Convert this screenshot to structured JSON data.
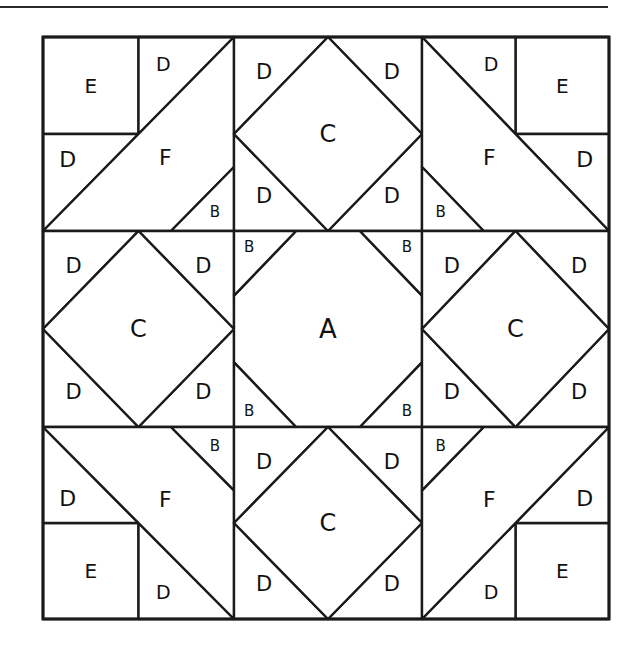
{
  "diagram": {
    "type": "quilt-block-template",
    "grid": {
      "rows": 3,
      "cols": 3,
      "x_lines": [
        43,
        234,
        422,
        609
      ],
      "y_lines": [
        37,
        231,
        427,
        619
      ]
    },
    "colors": {
      "line": "#1a1a1a",
      "fill": "#ffffff",
      "label": "#111111"
    },
    "blocks": [
      {
        "id": "top-left",
        "type": "corner-f",
        "orientation": "up-right",
        "pieces": [
          {
            "label": "E",
            "role": "square"
          },
          {
            "label": "D",
            "role": "triangle-top"
          },
          {
            "label": "D",
            "role": "triangle-left"
          },
          {
            "label": "F",
            "role": "trapezoid"
          },
          {
            "label": "B",
            "role": "small-triangle"
          }
        ]
      },
      {
        "id": "top-center",
        "type": "square-in-square",
        "pieces": [
          {
            "label": "C",
            "role": "diamond"
          },
          {
            "label": "D",
            "role": "corner-tl"
          },
          {
            "label": "D",
            "role": "corner-tr"
          },
          {
            "label": "D",
            "role": "corner-bl"
          },
          {
            "label": "D",
            "role": "corner-br"
          }
        ]
      },
      {
        "id": "top-right",
        "type": "corner-f",
        "orientation": "up-left",
        "pieces": [
          {
            "label": "E",
            "role": "square"
          },
          {
            "label": "D",
            "role": "triangle-top"
          },
          {
            "label": "D",
            "role": "triangle-right"
          },
          {
            "label": "F",
            "role": "trapezoid"
          },
          {
            "label": "B",
            "role": "small-triangle"
          }
        ]
      },
      {
        "id": "middle-left",
        "type": "square-in-square",
        "pieces": [
          {
            "label": "C",
            "role": "diamond"
          },
          {
            "label": "D",
            "role": "corner-tl"
          },
          {
            "label": "D",
            "role": "corner-tr"
          },
          {
            "label": "D",
            "role": "corner-bl"
          },
          {
            "label": "D",
            "role": "corner-br"
          }
        ]
      },
      {
        "id": "center",
        "type": "snowball",
        "pieces": [
          {
            "label": "A",
            "role": "octagon"
          },
          {
            "label": "B",
            "role": "corner-tl"
          },
          {
            "label": "B",
            "role": "corner-tr"
          },
          {
            "label": "B",
            "role": "corner-bl"
          },
          {
            "label": "B",
            "role": "corner-br"
          }
        ]
      },
      {
        "id": "middle-right",
        "type": "square-in-square",
        "pieces": [
          {
            "label": "C",
            "role": "diamond"
          },
          {
            "label": "D",
            "role": "corner-tl"
          },
          {
            "label": "D",
            "role": "corner-tr"
          },
          {
            "label": "D",
            "role": "corner-bl"
          },
          {
            "label": "D",
            "role": "corner-br"
          }
        ]
      },
      {
        "id": "bottom-left",
        "type": "corner-f",
        "orientation": "down-right",
        "pieces": [
          {
            "label": "E",
            "role": "square"
          },
          {
            "label": "D",
            "role": "triangle-bottom"
          },
          {
            "label": "D",
            "role": "triangle-left"
          },
          {
            "label": "F",
            "role": "trapezoid"
          },
          {
            "label": "B",
            "role": "small-triangle"
          }
        ]
      },
      {
        "id": "bottom-center",
        "type": "square-in-square",
        "pieces": [
          {
            "label": "C",
            "role": "diamond"
          },
          {
            "label": "D",
            "role": "corner-tl"
          },
          {
            "label": "D",
            "role": "corner-tr"
          },
          {
            "label": "D",
            "role": "corner-bl"
          },
          {
            "label": "D",
            "role": "corner-br"
          }
        ]
      },
      {
        "id": "bottom-right",
        "type": "corner-f",
        "orientation": "down-left",
        "pieces": [
          {
            "label": "E",
            "role": "square"
          },
          {
            "label": "D",
            "role": "triangle-bottom"
          },
          {
            "label": "D",
            "role": "triangle-right"
          },
          {
            "label": "F",
            "role": "trapezoid"
          },
          {
            "label": "B",
            "role": "small-triangle"
          }
        ]
      }
    ]
  }
}
